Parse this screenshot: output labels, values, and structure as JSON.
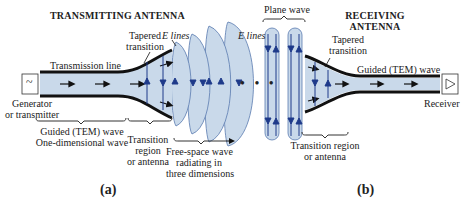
{
  "colors": {
    "fill": "#c9d9ea",
    "field_line": "#1e3a8a",
    "conductor": "#111111",
    "text": "#222222"
  },
  "panel_a": {
    "title": "TRANSMITTING ANTENNA",
    "source_symbol": "~",
    "labels": {
      "transmission_line": "Transmission line",
      "tapered_line1": "Tapered",
      "tapered_line2": "transition",
      "e_lines": "E lines",
      "generator_line1": "Generator",
      "generator_line2": "or transmitter",
      "guided_line1": "Guided (TEM) wave",
      "guided_line2": "One-dimensional wave",
      "transition_line1": "Transition",
      "transition_line2": "region",
      "transition_line3": "or antenna",
      "freespace_line1": "Free-space wave",
      "freespace_line2": "radiating in",
      "freespace_line3": "three dimensions"
    },
    "caption": "(a)"
  },
  "panel_b": {
    "title_line1": "RECEIVING",
    "title_line2": "ANTENNA",
    "labels": {
      "plane_wave": "Plane wave",
      "e_lines": "E lines",
      "tapered_line1": "Tapered",
      "tapered_line2": "transition",
      "guided": "Guided (TEM) wave",
      "receiver": "Receiver",
      "transition_line1": "Transition region",
      "transition_line2": "or antenna"
    },
    "caption": "(b)"
  },
  "ellipsis": "• • •"
}
